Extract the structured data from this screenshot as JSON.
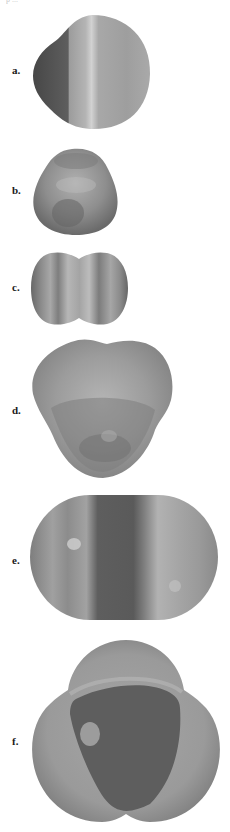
{
  "header": {
    "running_text": "p ..."
  },
  "figure": {
    "panels": [
      {
        "label": "a.",
        "shape": "rounded-triangular blob with vertical bands (dark left third)"
      },
      {
        "label": "b.",
        "shape": "small lumpy trilobed blob"
      },
      {
        "label": "c.",
        "shape": "two-lobed rounded square with vertical stripes"
      },
      {
        "label": "d.",
        "shape": "heart-like trilobed blob"
      },
      {
        "label": "e.",
        "shape": "stadium-shaped oval with vertical bands"
      },
      {
        "label": "f.",
        "shape": "trilobed shape with dark triangular center"
      }
    ],
    "colors": {
      "background": "#ffffff",
      "dark_gray": "#5a5a5a",
      "mid_gray": "#8c8c8c",
      "light_gray": "#b8b8b8",
      "highlight": "#d0d0d0"
    }
  }
}
